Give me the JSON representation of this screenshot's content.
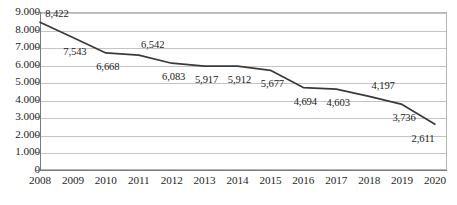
{
  "chart_data": {
    "type": "line",
    "title": "",
    "subtitle": "",
    "xlabel": "",
    "ylabel": "",
    "categories": [
      "2008",
      "2009",
      "2010",
      "2011",
      "2012",
      "2013",
      "2014",
      "2015",
      "2016",
      "2017",
      "2018",
      "2019",
      "2020"
    ],
    "values": [
      8422,
      7543,
      6668,
      6542,
      6083,
      5917,
      5912,
      5677,
      4694,
      4603,
      4197,
      3736,
      2611
    ],
    "point_labels": [
      "8,422",
      "7,543",
      "6,668",
      "6,542",
      "6,083",
      "5,917",
      "5,912",
      "5,677",
      "4,694",
      "4,603",
      "4,197",
      "3,736",
      "2,611"
    ],
    "label_positions": [
      "above",
      "below",
      "below",
      "above",
      "below",
      "below",
      "below",
      "below",
      "below",
      "below",
      "above",
      "below",
      "below"
    ],
    "series": [
      {
        "name": "",
        "values": [
          8422,
          7543,
          6668,
          6542,
          6083,
          5917,
          5912,
          5677,
          4694,
          4603,
          4197,
          3736,
          2611
        ],
        "color": "#3a3a3a"
      }
    ],
    "ylim": [
      0,
      9000
    ],
    "ytick_values": [
      9000,
      8000,
      7000,
      6000,
      5000,
      4000,
      3000,
      2000,
      1000,
      0
    ],
    "ytick_labels": [
      "9.000",
      "8.000",
      "7.000",
      "6.000",
      "5.000",
      "4.000",
      "3.000",
      "2.000",
      "1.000",
      "0"
    ],
    "grid": true,
    "grid_axis": "y",
    "legend": false,
    "legend_position": "none",
    "markers": false
  },
  "axes": {
    "y_tick_labels": [
      "9.000",
      "8.000",
      "7.000",
      "6.000",
      "5.000",
      "4.000",
      "3.000",
      "2.000",
      "1.000",
      "0"
    ],
    "x_tick_labels": [
      "2008",
      "2009",
      "2010",
      "2011",
      "2012",
      "2013",
      "2014",
      "2015",
      "2016",
      "2017",
      "2018",
      "2019",
      "2020"
    ]
  },
  "caption": {
    "text": "",
    "visible": false
  },
  "colors": {
    "line": "#3a3a3a",
    "gridline": "#c4c4c4",
    "axis": "#7a7a7a",
    "plot_border": "#b6b6b6",
    "tick_text": "#1f1f1f",
    "data_label_text": "#232323",
    "background": "#ffffff"
  }
}
